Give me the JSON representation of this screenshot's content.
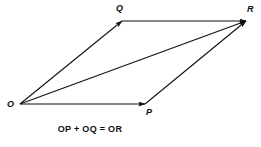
{
  "figure": {
    "background_color": "#ffffff",
    "stroke_color": "#111111",
    "text_color": "#111111",
    "canvas": {
      "width": 261,
      "height": 147
    }
  },
  "vertices": {
    "origin": {
      "label": "O",
      "x": 20,
      "y": 104
    },
    "top_left": {
      "label": "Q",
      "x": 122,
      "y": 21
    },
    "top_right": {
      "label": "R",
      "x": 246,
      "y": 21
    },
    "bottom_middle": {
      "label": "P",
      "x": 145,
      "y": 104
    }
  },
  "vectors": [
    {
      "name": "OQ",
      "from": "O",
      "to": "Q",
      "x1": 20,
      "y1": 104,
      "x2": 122,
      "y2": 21,
      "arrow_at_end": true
    },
    {
      "name": "OP",
      "from": "O",
      "to": "P",
      "x1": 20,
      "y1": 104,
      "x2": 145,
      "y2": 104,
      "arrow_at_end": true
    },
    {
      "name": "OR",
      "from": "O",
      "to": "R",
      "x1": 20,
      "y1": 104,
      "x2": 246,
      "y2": 21,
      "arrow_at_end": true
    },
    {
      "name": "QR",
      "from": "Q",
      "to": "R",
      "x1": 122,
      "y1": 21,
      "x2": 246,
      "y2": 21,
      "arrow_at_end": true
    },
    {
      "name": "PR",
      "from": "P",
      "to": "R",
      "x1": 145,
      "y1": 104,
      "x2": 246,
      "y2": 21,
      "arrow_at_end": true
    }
  ],
  "caption": {
    "equation": "OP + OQ = OR"
  }
}
